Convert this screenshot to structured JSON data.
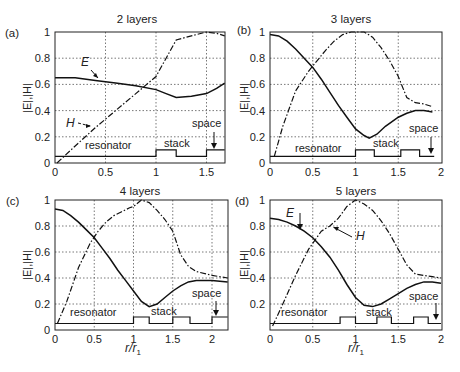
{
  "figure": {
    "xlabel": "r/r1",
    "ylabel": "|E|,|H|"
  },
  "chart_data": [
    {
      "id": "a",
      "type": "line",
      "panel_label": "(a)",
      "title": "2 layers",
      "xlabel": "",
      "ylabel": "|E|,|H|",
      "xlim": [
        0,
        1.68
      ],
      "ylim": [
        0,
        1
      ],
      "xticks": [
        "0",
        "0.5",
        "1",
        "1.5"
      ],
      "yticks": [
        "0",
        "0.2",
        "0.4",
        "0.6",
        "0.8",
        "1"
      ],
      "grid": true,
      "series": [
        {
          "name": "E",
          "style": "solid",
          "x": [
            0,
            0.2,
            0.4,
            0.6,
            0.8,
            1.0,
            1.1,
            1.2,
            1.35,
            1.5,
            1.6,
            1.68
          ],
          "y": [
            0.65,
            0.65,
            0.63,
            0.61,
            0.59,
            0.56,
            0.53,
            0.5,
            0.51,
            0.53,
            0.57,
            0.61
          ]
        },
        {
          "name": "H",
          "style": "dash-dot",
          "x": [
            0.02,
            0.2,
            0.4,
            0.6,
            0.8,
            1.0,
            1.1,
            1.2,
            1.35,
            1.5,
            1.6,
            1.68
          ],
          "y": [
            0.0,
            0.13,
            0.27,
            0.4,
            0.53,
            0.66,
            0.8,
            0.94,
            0.97,
            1.0,
            0.99,
            0.97
          ]
        }
      ],
      "profile": {
        "x": [
          0,
          1.0,
          1.0,
          1.2,
          1.2,
          1.5,
          1.5,
          1.68
        ],
        "y": [
          0.05,
          0.05,
          0.1,
          0.1,
          0.05,
          0.05,
          0.1,
          0.1
        ]
      },
      "annotations": [
        {
          "text": "E",
          "italic": true
        },
        {
          "text": "H",
          "italic": true
        },
        {
          "text": "resonator"
        },
        {
          "text": "stack"
        },
        {
          "text": "space"
        }
      ]
    },
    {
      "id": "b",
      "type": "line",
      "panel_label": "(b)",
      "title": "3 layers",
      "xlabel": "",
      "ylabel": "|E|,|H|",
      "xlim": [
        0,
        2
      ],
      "ylim": [
        0,
        1
      ],
      "xticks": [
        "0",
        "0.5",
        "1",
        "1.5",
        "2"
      ],
      "yticks": [
        "0",
        "0.2",
        "0.4",
        "0.6",
        "0.8",
        "1"
      ],
      "grid": true,
      "series": [
        {
          "name": "E",
          "style": "solid",
          "x": [
            0,
            0.1,
            0.2,
            0.3,
            0.4,
            0.5,
            0.6,
            0.7,
            0.8,
            0.9,
            1.0,
            1.1,
            1.16,
            1.25,
            1.35,
            1.5,
            1.6,
            1.7,
            1.8,
            1.9
          ],
          "y": [
            0.98,
            0.97,
            0.93,
            0.87,
            0.8,
            0.73,
            0.64,
            0.54,
            0.44,
            0.35,
            0.26,
            0.21,
            0.19,
            0.22,
            0.28,
            0.35,
            0.38,
            0.4,
            0.4,
            0.39
          ]
        },
        {
          "name": "H",
          "style": "dash-dot",
          "x": [
            0.05,
            0.15,
            0.3,
            0.45,
            0.55,
            0.65,
            0.75,
            0.85,
            0.95,
            1.0,
            1.1,
            1.2,
            1.3,
            1.4,
            1.5,
            1.55,
            1.6,
            1.7,
            1.8,
            1.9
          ],
          "y": [
            0.05,
            0.28,
            0.55,
            0.7,
            0.78,
            0.86,
            0.93,
            0.98,
            1.0,
            1.0,
            1.0,
            0.96,
            0.88,
            0.78,
            0.66,
            0.58,
            0.5,
            0.46,
            0.45,
            0.43
          ]
        }
      ],
      "profile": {
        "x": [
          0,
          1.0,
          1.0,
          1.22,
          1.22,
          1.53,
          1.53,
          1.75,
          1.75,
          1.92
        ],
        "y": [
          0.05,
          0.05,
          0.1,
          0.1,
          0.05,
          0.05,
          0.1,
          0.1,
          0.05,
          0.05
        ]
      },
      "annotations": [
        {
          "text": "resonator"
        },
        {
          "text": "stack"
        },
        {
          "text": "space"
        }
      ]
    },
    {
      "id": "c",
      "type": "line",
      "panel_label": "(c)",
      "title": "4 layers",
      "xlabel": "r/r1",
      "ylabel": "|E|,|H|",
      "xlim": [
        0,
        2.2
      ],
      "ylim": [
        0,
        1
      ],
      "xticks": [
        "0",
        "0.5",
        "1",
        "1.5",
        "2"
      ],
      "yticks": [
        "0",
        "0.2",
        "0.4",
        "0.6",
        "0.8",
        "1"
      ],
      "grid": true,
      "series": [
        {
          "name": "E",
          "style": "solid",
          "x": [
            0,
            0.1,
            0.2,
            0.3,
            0.4,
            0.5,
            0.6,
            0.7,
            0.8,
            0.9,
            1.0,
            1.1,
            1.2,
            1.3,
            1.4,
            1.5,
            1.6,
            1.7,
            1.8,
            2.0,
            2.2
          ],
          "y": [
            0.93,
            0.92,
            0.88,
            0.83,
            0.77,
            0.71,
            0.63,
            0.55,
            0.46,
            0.38,
            0.3,
            0.22,
            0.18,
            0.2,
            0.25,
            0.3,
            0.34,
            0.37,
            0.38,
            0.38,
            0.37
          ]
        },
        {
          "name": "H",
          "style": "dash-dot",
          "x": [
            0.03,
            0.15,
            0.3,
            0.45,
            0.55,
            0.65,
            0.75,
            0.85,
            0.95,
            1.0,
            1.1,
            1.2,
            1.3,
            1.4,
            1.5,
            1.6,
            1.7,
            1.8,
            2.0,
            2.2
          ],
          "y": [
            0.05,
            0.22,
            0.48,
            0.67,
            0.76,
            0.83,
            0.88,
            0.91,
            0.94,
            0.95,
            1.0,
            0.98,
            0.92,
            0.85,
            0.76,
            0.58,
            0.49,
            0.45,
            0.42,
            0.4
          ]
        }
      ],
      "profile": {
        "x": [
          0,
          1.0,
          1.0,
          1.2,
          1.2,
          1.5,
          1.5,
          1.72,
          1.72,
          2.0,
          2.0,
          2.2
        ],
        "y": [
          0.05,
          0.05,
          0.1,
          0.1,
          0.05,
          0.05,
          0.1,
          0.1,
          0.05,
          0.05,
          0.1,
          0.1
        ]
      },
      "annotations": [
        {
          "text": "resonator"
        },
        {
          "text": "stack"
        },
        {
          "text": "space"
        }
      ]
    },
    {
      "id": "d",
      "type": "line",
      "panel_label": "(d)",
      "title": "5 layers",
      "xlabel": "r/r1",
      "ylabel": "|E|,|H|",
      "xlim": [
        0,
        2
      ],
      "ylim": [
        0,
        1
      ],
      "xticks": [
        "0",
        "0.5",
        "1",
        "1.5",
        "2"
      ],
      "yticks": [
        "0.2",
        "0.4",
        "0.6",
        "0.8",
        "1"
      ],
      "grid": true,
      "series": [
        {
          "name": "E",
          "style": "solid",
          "x": [
            0,
            0.1,
            0.2,
            0.3,
            0.4,
            0.5,
            0.6,
            0.7,
            0.8,
            0.9,
            1.0,
            1.1,
            1.2,
            1.3,
            1.4,
            1.5,
            1.6,
            1.7,
            1.8,
            1.9,
            2.0
          ],
          "y": [
            0.86,
            0.85,
            0.83,
            0.8,
            0.76,
            0.71,
            0.64,
            0.56,
            0.46,
            0.35,
            0.25,
            0.19,
            0.18,
            0.2,
            0.24,
            0.28,
            0.32,
            0.35,
            0.37,
            0.37,
            0.36
          ]
        },
        {
          "name": "H",
          "style": "dash-dot",
          "x": [
            0.03,
            0.15,
            0.3,
            0.45,
            0.6,
            0.7,
            0.8,
            0.9,
            1.0,
            1.1,
            1.2,
            1.3,
            1.4,
            1.5,
            1.6,
            1.7,
            1.8,
            1.9,
            2.0
          ],
          "y": [
            0.03,
            0.2,
            0.42,
            0.62,
            0.76,
            0.8,
            0.86,
            0.95,
            1.0,
            0.97,
            0.92,
            0.84,
            0.74,
            0.62,
            0.5,
            0.43,
            0.42,
            0.41,
            0.4
          ]
        }
      ],
      "profile": {
        "x": [
          0,
          0.82,
          0.82,
          1.0,
          1.0,
          1.25,
          1.25,
          1.42,
          1.42,
          1.68,
          1.68,
          1.85,
          1.85,
          2.0
        ],
        "y": [
          0.05,
          0.05,
          0.1,
          0.1,
          0.05,
          0.05,
          0.1,
          0.1,
          0.05,
          0.05,
          0.1,
          0.1,
          0.05,
          0.05
        ]
      },
      "annotations": [
        {
          "text": "E",
          "italic": true
        },
        {
          "text": "H",
          "italic": true
        },
        {
          "text": "resonator"
        },
        {
          "text": "stack"
        },
        {
          "text": "space"
        }
      ]
    }
  ]
}
